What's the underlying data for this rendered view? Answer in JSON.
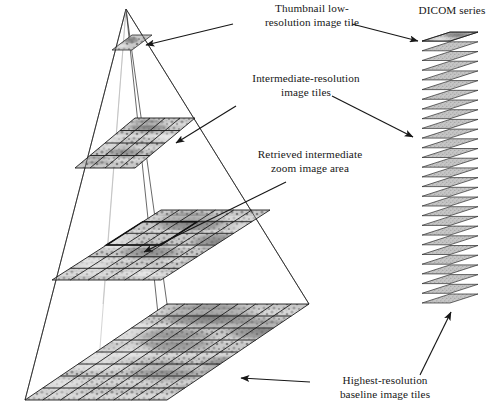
{
  "figure": {
    "domain": "diagram",
    "background_color": "#ffffff",
    "ink_color": "#171717",
    "labels": {
      "thumbnail": "Thumbnail low-\nresolution image tile",
      "intermediate": "Intermediate-resolution\nimage tiles",
      "retrieved": "Retrieved intermediate\nzoom image area",
      "highest": "Highest-resolution\nbaseline image tiles",
      "dicom": "DICOM series"
    },
    "pyramid": {
      "apex": {
        "x": 126,
        "y": 9
      },
      "levels": [
        {
          "name": "thumbnail-tile-layer",
          "grid_cols": 1,
          "grid_rows": 1,
          "half_width": 20,
          "depth": 8,
          "center_x": 132,
          "center_y": 43
        },
        {
          "name": "intermediate-tile-layer-a",
          "grid_cols": 4,
          "grid_rows": 4,
          "half_width": 60,
          "depth": 25,
          "center_x": 135,
          "center_y": 143
        },
        {
          "name": "intermediate-tile-layer-b",
          "grid_cols": 6,
          "grid_rows": 6,
          "half_width": 109,
          "depth": 35,
          "center_x": 161,
          "center_y": 245
        },
        {
          "name": "baseline-tile-layer",
          "grid_cols": 8,
          "grid_rows": 8,
          "half_width": 142,
          "depth": 48,
          "center_x": 167,
          "center_y": 352
        }
      ]
    },
    "retrieved_area": {
      "layer": "intermediate-tile-layer-b",
      "col_start": 2,
      "col_end": 4,
      "row_start": 2,
      "row_end": 4
    },
    "dicom_stack": {
      "slice_count": 28,
      "top_y": 30,
      "bottom_y": 300,
      "slice_half_width": 28,
      "slice_depth": 9,
      "center_x": 450,
      "highlighted_slice_index": 0
    },
    "arrows": [
      {
        "name": "arrow-thumbnail-to-tile",
        "x1": 233,
        "y1": 24,
        "x2": 145,
        "y2": 45
      },
      {
        "name": "arrow-intermediate-to-tiles",
        "x1": 236,
        "y1": 106,
        "x2": 175,
        "y2": 142
      },
      {
        "name": "arrow-retrieved-to-area",
        "x1": 283,
        "y1": 183,
        "x2": 143,
        "y2": 252
      },
      {
        "name": "arrow-highest-to-tiles",
        "x1": 308,
        "y1": 382,
        "x2": 240,
        "y2": 378
      },
      {
        "name": "arrow-thumbnail-to-dicom",
        "x1": 352,
        "y1": 24,
        "x2": 420,
        "y2": 40
      },
      {
        "name": "arrow-intermediate-to-dicom",
        "x1": 333,
        "y1": 97,
        "x2": 414,
        "y2": 136
      },
      {
        "name": "arrow-baseline-to-dicom",
        "x1": 423,
        "y1": 372,
        "x2": 450,
        "y2": 313
      }
    ]
  }
}
